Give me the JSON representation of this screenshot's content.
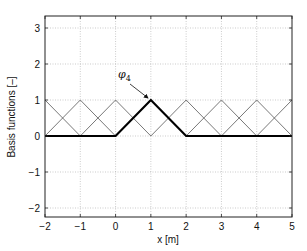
{
  "chart_data": {
    "type": "line",
    "title": "",
    "xlabel": "x [m]",
    "ylabel": "Basis functions [–]",
    "xlim": [
      -2,
      5
    ],
    "ylim": [
      -2.3,
      3.3
    ],
    "xticks": [
      -2,
      -1,
      0,
      1,
      2,
      3,
      4,
      5
    ],
    "yticks": [
      -2,
      -1,
      0,
      1,
      2,
      3
    ],
    "xtick_labels": [
      "−2",
      "−1",
      "0",
      "1",
      "2",
      "3",
      "4",
      "5"
    ],
    "ytick_labels": [
      "−2",
      "−1",
      "0",
      "1",
      "2",
      "3"
    ],
    "grid": true,
    "legend": null,
    "nodes": [
      -2,
      -1,
      0,
      1,
      2,
      3,
      4,
      5
    ],
    "series": [
      {
        "name": "phi_1",
        "x": [
          -2,
          -1
        ],
        "y": [
          1,
          0
        ],
        "style": "thin"
      },
      {
        "name": "phi_2",
        "x": [
          -2,
          -1,
          0
        ],
        "y": [
          0,
          1,
          0
        ],
        "style": "thin"
      },
      {
        "name": "phi_3",
        "x": [
          -1,
          0,
          1
        ],
        "y": [
          0,
          1,
          0
        ],
        "style": "thin"
      },
      {
        "name": "phi_4",
        "x": [
          -2,
          0,
          1,
          2,
          5
        ],
        "y": [
          0,
          0,
          1,
          0,
          0
        ],
        "style": "bold"
      },
      {
        "name": "phi_5",
        "x": [
          1,
          2,
          3
        ],
        "y": [
          0,
          1,
          0
        ],
        "style": "thin"
      },
      {
        "name": "phi_6",
        "x": [
          2,
          3,
          4
        ],
        "y": [
          0,
          1,
          0
        ],
        "style": "thin"
      },
      {
        "name": "phi_7",
        "x": [
          3,
          4,
          5
        ],
        "y": [
          0,
          1,
          0
        ],
        "style": "thin"
      },
      {
        "name": "phi_8",
        "x": [
          4,
          5
        ],
        "y": [
          0,
          1
        ],
        "style": "thin"
      }
    ],
    "annotations": [
      {
        "text": "φ",
        "subscript": "4",
        "text_x": 0.2,
        "text_y": 1.75,
        "arrow_to": [
          0.95,
          1.02
        ]
      }
    ]
  },
  "labels": {
    "xlabel": "x [m]",
    "ylabel": "Basis functions [–]",
    "annotation_symbol": "φ",
    "annotation_sub": "4"
  }
}
